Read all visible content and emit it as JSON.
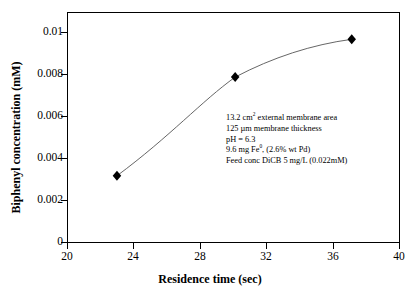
{
  "chart_data": {
    "type": "scatter",
    "title": "",
    "xlabel": "Residence time (sec)",
    "ylabel": "Biphenyl concentration (mM)",
    "xlim": [
      20,
      40
    ],
    "ylim": [
      0,
      0.011
    ],
    "xticks": [
      "20",
      "24",
      "28",
      "32",
      "36",
      "40"
    ],
    "xtick_values": [
      20,
      24,
      28,
      32,
      36,
      40
    ],
    "yticks": [
      "0",
      "0.002",
      "0.004",
      "0.006",
      "0.008",
      "0.01"
    ],
    "ytick_values": [
      0,
      0.002,
      0.004,
      0.006,
      0.008,
      0.01
    ],
    "grid": false,
    "legend": false,
    "series": [
      {
        "name": "Biphenyl concentration",
        "marker": "filled-diamond",
        "marker_color": "#000000",
        "line_color": "#555555",
        "x": [
          23.0,
          30.1,
          37.1
        ],
        "y": [
          0.0032,
          0.0079,
          0.0097
        ]
      }
    ],
    "annotations": [
      "13.2 cm2 external membrane area",
      "125 µm membrane thickness",
      "pH = 6.3",
      "9.6 mg Fe0, (2.6% wt Pd)",
      "Feed conc DiCB 5 mg/L (0.022mM)"
    ]
  },
  "annotation_lines": {
    "line1_pre": "13.2 cm",
    "line1_sup": "2",
    "line1_post": " external membrane area",
    "line2": "125 µm membrane thickness",
    "line3": "pH = 6.3",
    "line4_pre": "9.6 mg Fe",
    "line4_sup": "0",
    "line4_post": ", (2.6% wt Pd)",
    "line5": "Feed conc DiCB 5 mg/L (0.022mM)"
  },
  "axis": {
    "x_title": "Residence time (sec)",
    "y_title": "Biphenyl concentration (mM)"
  },
  "colors": {
    "axis": "#000000",
    "marker": "#000000",
    "curve": "#555555",
    "background": "#ffffff"
  }
}
